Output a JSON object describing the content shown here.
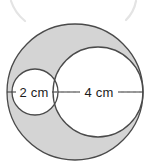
{
  "figure": {
    "labels": {
      "small_diameter": "2 cm",
      "large_diameter": "4 cm"
    },
    "colors": {
      "shaded_fill": "#d4d4d4",
      "inner_fill": "#ffffff",
      "stroke": "#4a4a4a",
      "dashed_stroke": "#7a7a7a",
      "solid_line": "#3a3a3a",
      "ghost_arc": "#e2e2e2",
      "text": "#1c1c1c",
      "page_background": "#ffffff"
    },
    "geometry": {
      "outer_circle": {
        "cx": 75,
        "cy": 92,
        "r": 68,
        "diameter_cm": 6
      },
      "small_circle": {
        "cx": 35,
        "cy": 92,
        "r": 23,
        "diameter_cm": 2
      },
      "large_circle": {
        "cx": 98,
        "cy": 92,
        "r": 45,
        "diameter_cm": 4
      },
      "baseline_y": 92,
      "solid_line_x1": 7,
      "solid_line_x2": 143
    }
  }
}
